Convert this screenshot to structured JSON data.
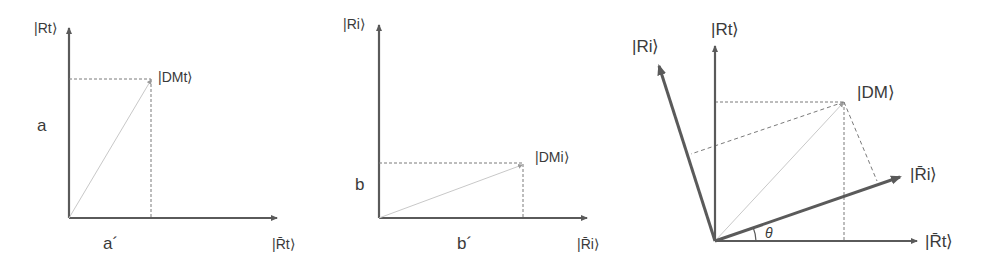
{
  "panels": [
    {
      "id": "panel-1",
      "y_axis_label": "|Rt⟩",
      "x_axis_label": "|R̄t⟩",
      "vector_label": "|DMt⟩",
      "y_component_label": "a",
      "x_component_label": "a´"
    },
    {
      "id": "panel-2",
      "y_axis_label": "|Ri⟩",
      "x_axis_label": "|R̄i⟩",
      "vector_label": "|DMi⟩",
      "y_component_label": "b",
      "x_component_label": "b´"
    },
    {
      "id": "panel-3",
      "rt_axis_label": "|Rt⟩",
      "rt_bar_axis_label": "|R̄t⟩",
      "ri_axis_label": "|Ri⟩",
      "ri_bar_axis_label": "|R̄i⟩",
      "vector_label": "|DM⟩",
      "angle_label": "θ"
    }
  ],
  "colors": {
    "axis": "#5a5a5a",
    "vector": "#c8c8c8",
    "dashed": "#7a7a7a",
    "text": "#3a3a3a"
  }
}
